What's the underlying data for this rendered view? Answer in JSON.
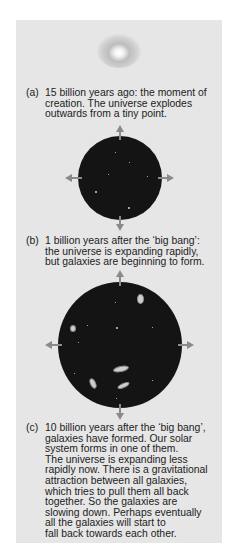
{
  "cutoff_text": "",
  "stages": [
    {
      "label": "(a)",
      "text": "15 billion years ago: the moment of\ncreation.  The universe explodes\noutwards from a tiny point."
    },
    {
      "label": "(b)",
      "text": "1 billion years after the ‘big bang’:\nthe universe is expanding rapidly,\nbut galaxies are beginning to form."
    },
    {
      "label": "(c)",
      "text": "10 billion years after the ‘big bang’,\ngalaxies have formed.  Our solar\nsystem forms in one of them.\nThe universe is expanding less\nrapidly now. There is a gravitational\nattraction between all galaxies,\nwhich tries to pull them all back\ntogether.  So the galaxies are\nslowing down.  Perhaps eventually\nall the galaxies will start to\nfall back towards each other."
    }
  ],
  "colors": {
    "panel_bg": "#e6e6e6",
    "universe": "#141414",
    "arrow": "#8a8a8a"
  }
}
